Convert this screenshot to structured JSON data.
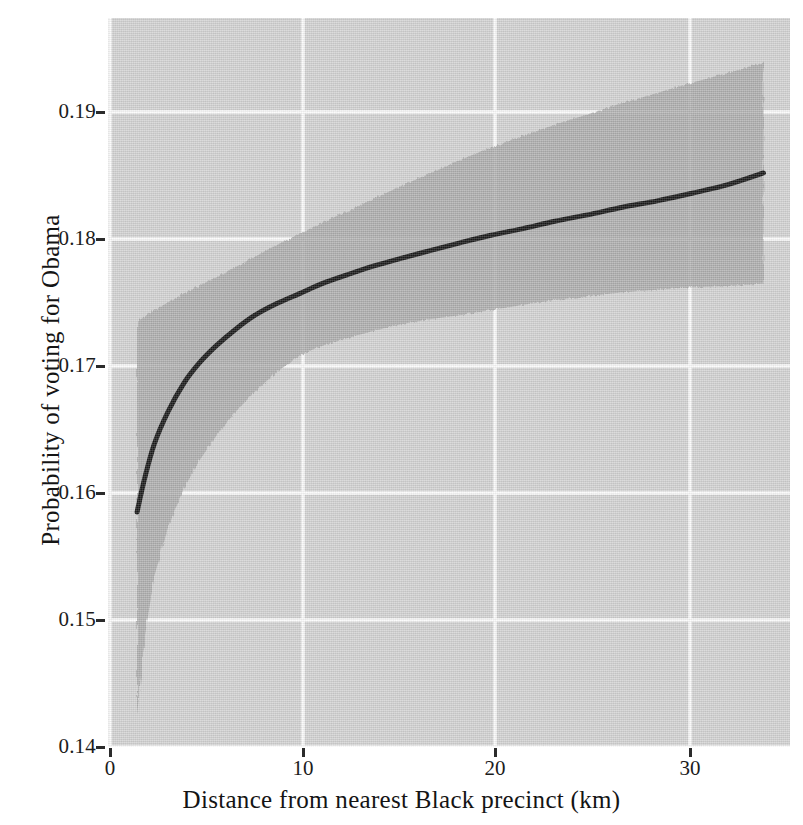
{
  "chart_data": {
    "type": "line",
    "title": "",
    "subtitle": "",
    "xlabel": "Distance from nearest Black precinct (km)",
    "ylabel": "Probability of voting for Obama",
    "xlim": [
      -0.1,
      35.3
    ],
    "ylim": [
      0.14,
      0.1974
    ],
    "xticks": [
      0,
      10,
      20,
      30
    ],
    "xtick_labels": [
      "0",
      "10",
      "20",
      "30"
    ],
    "yticks": [
      0.14,
      0.15,
      0.16,
      0.17,
      0.18,
      0.19
    ],
    "ytick_labels": [
      "0.14",
      "0.15",
      "0.16",
      "0.17",
      "0.18",
      "0.19"
    ],
    "grid": true,
    "grid_color": "#ffffff",
    "panel_background": "#d4d4d4",
    "legend": null,
    "annotations": [],
    "series": [
      {
        "name": "Predicted probability of voting for Obama",
        "kind": "line",
        "color": "#111111",
        "linewidth": 5,
        "x": [
          1.4,
          1.8,
          2.3,
          3.0,
          3.8,
          4.6,
          5.5,
          6.5,
          7.5,
          8.6,
          9.8,
          11.0,
          12.3,
          13.7,
          15.1,
          16.6,
          18.1,
          19.7,
          21.3,
          23.0,
          24.7,
          26.5,
          28.3,
          30.1,
          32.0,
          33.8
        ],
        "y": [
          0.1585,
          0.1612,
          0.1639,
          0.1664,
          0.1686,
          0.1702,
          0.1716,
          0.1729,
          0.174,
          0.1749,
          0.1757,
          0.1765,
          0.1772,
          0.1779,
          0.1785,
          0.1791,
          0.1797,
          0.1803,
          0.1808,
          0.1814,
          0.1819,
          0.1825,
          0.183,
          0.1836,
          0.1843,
          0.1852
        ]
      }
    ],
    "confidence_band": {
      "name": "95% confidence interval",
      "color": "#a8a8a8",
      "opacity": 0.85,
      "x": [
        1.4,
        1.8,
        2.3,
        3.0,
        3.8,
        4.6,
        5.5,
        6.5,
        7.5,
        8.6,
        9.8,
        11.0,
        12.3,
        13.7,
        15.1,
        16.6,
        18.1,
        19.7,
        21.3,
        23.0,
        24.7,
        26.5,
        28.3,
        30.1,
        32.0,
        33.8
      ],
      "upper": [
        0.1735,
        0.1739,
        0.1744,
        0.175,
        0.1757,
        0.1763,
        0.177,
        0.1778,
        0.1786,
        0.1795,
        0.1804,
        0.1813,
        0.1822,
        0.1832,
        0.1842,
        0.1852,
        0.1862,
        0.1872,
        0.1881,
        0.189,
        0.1898,
        0.1907,
        0.1915,
        0.1923,
        0.1931,
        0.1939
      ],
      "lower": [
        0.1425,
        0.1487,
        0.1535,
        0.1573,
        0.1603,
        0.1625,
        0.1645,
        0.1664,
        0.168,
        0.1695,
        0.1708,
        0.1716,
        0.1722,
        0.1728,
        0.1733,
        0.1737,
        0.174,
        0.1744,
        0.1748,
        0.1752,
        0.1755,
        0.1758,
        0.176,
        0.1762,
        0.1763,
        0.1765
      ]
    }
  },
  "axes": {
    "x_title": "Distance from nearest Black precinct (km)",
    "y_title": "Probability of voting for Obama",
    "x_tick_labels": [
      "0",
      "10",
      "20",
      "30"
    ],
    "y_tick_labels": [
      "0.14",
      "0.15",
      "0.16",
      "0.17",
      "0.18",
      "0.19"
    ]
  }
}
